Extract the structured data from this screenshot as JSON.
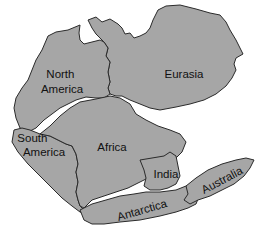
{
  "diagram": {
    "type": "map",
    "land_color": "#a6a6a6",
    "outline_color": "#2a2a2a",
    "continents": [
      {
        "id": "north-america",
        "label_lines": [
          "North",
          "America"
        ]
      },
      {
        "id": "eurasia",
        "label_lines": [
          "Eurasia"
        ]
      },
      {
        "id": "south-america",
        "label_lines": [
          "South",
          "America"
        ]
      },
      {
        "id": "africa",
        "label_lines": [
          "Africa"
        ]
      },
      {
        "id": "india",
        "label_lines": [
          "India"
        ]
      },
      {
        "id": "antarctica",
        "label_lines": [
          "Antarctica"
        ]
      },
      {
        "id": "australia",
        "label_lines": [
          "Australia"
        ]
      }
    ]
  }
}
